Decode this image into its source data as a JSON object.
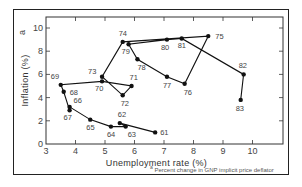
{
  "chart_data": {
    "type": "line",
    "title": "",
    "xlabel": "Unemployment rate  (%)",
    "ylabel": "Inflation  (%)",
    "ylabel_superscript": "a",
    "xlim": [
      3,
      10.5
    ],
    "ylim": [
      0,
      10.8
    ],
    "xticks": [
      3,
      4,
      5,
      6,
      7,
      8,
      9,
      10
    ],
    "yticks": [
      0,
      2,
      4,
      6,
      8,
      10
    ],
    "grid": false,
    "legend": null,
    "footnote": {
      "marker": "a",
      "text": "Percent change in GNP implicit price deflator"
    },
    "series": [
      {
        "name": "1961-1983",
        "points": [
          {
            "label": "61",
            "x": 6.7,
            "y": 1.0
          },
          {
            "label": "62",
            "x": 5.5,
            "y": 1.8
          },
          {
            "label": "63",
            "x": 5.7,
            "y": 1.5
          },
          {
            "label": "64",
            "x": 5.2,
            "y": 1.5
          },
          {
            "label": "65",
            "x": 4.5,
            "y": 2.1
          },
          {
            "label": "66",
            "x": 3.8,
            "y": 3.2
          },
          {
            "label": "67",
            "x": 3.8,
            "y": 2.9
          },
          {
            "label": "68",
            "x": 3.6,
            "y": 4.5
          },
          {
            "label": "69",
            "x": 3.5,
            "y": 5.1
          },
          {
            "label": "70",
            "x": 4.9,
            "y": 5.4
          },
          {
            "label": "71",
            "x": 5.9,
            "y": 5.0
          },
          {
            "label": "72",
            "x": 5.6,
            "y": 4.2
          },
          {
            "label": "73",
            "x": 4.9,
            "y": 5.8
          },
          {
            "label": "74",
            "x": 5.6,
            "y": 8.8
          },
          {
            "label": "75",
            "x": 8.5,
            "y": 9.3
          },
          {
            "label": "76",
            "x": 7.7,
            "y": 5.2
          },
          {
            "label": "77",
            "x": 7.1,
            "y": 5.8
          },
          {
            "label": "78",
            "x": 6.1,
            "y": 7.3
          },
          {
            "label": "79",
            "x": 5.8,
            "y": 8.6
          },
          {
            "label": "80",
            "x": 7.1,
            "y": 9.0
          },
          {
            "label": "81",
            "x": 7.6,
            "y": 9.1
          },
          {
            "label": "82",
            "x": 9.7,
            "y": 6.0
          },
          {
            "label": "83",
            "x": 9.6,
            "y": 3.8
          }
        ]
      }
    ]
  },
  "label_offsets": {
    "61": [
      5,
      3
    ],
    "62": [
      -2,
      -6
    ],
    "63": [
      2,
      10
    ],
    "64": [
      -4,
      10
    ],
    "65": [
      -4,
      10
    ],
    "66": [
      4,
      -4
    ],
    "67": [
      -6,
      10
    ],
    "68": [
      6,
      3
    ],
    "69": [
      -10,
      -6
    ],
    "70": [
      -7,
      10
    ],
    "71": [
      -2,
      -6
    ],
    "72": [
      -2,
      11
    ],
    "73": [
      -14,
      -3
    ],
    "74": [
      -4,
      -6
    ],
    "75": [
      7,
      3
    ],
    "76": [
      -1,
      11
    ],
    "77": [
      -4,
      11
    ],
    "78": [
      0,
      11
    ],
    "79": [
      -7,
      10
    ],
    "80": [
      -6,
      10
    ],
    "81": [
      -4,
      10
    ],
    "82": [
      -5,
      -6
    ],
    "83": [
      -5,
      11
    ]
  }
}
